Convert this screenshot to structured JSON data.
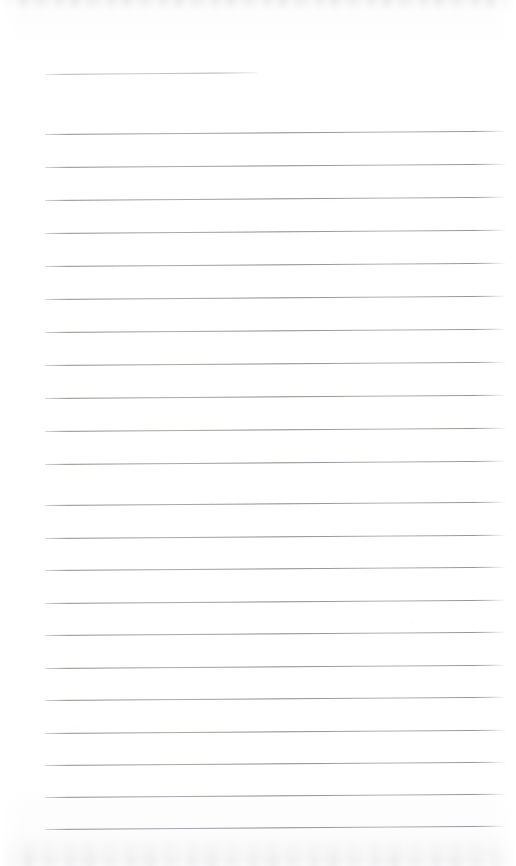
{
  "document": {
    "kind": "scanned-blank-ruled-page",
    "page_width": 516,
    "page_height": 866,
    "background_color": "#ffffff",
    "rule_color": "#8a8a94",
    "content_text": ""
  },
  "scan_artifacts": {
    "top_band": {
      "y": 0,
      "height": 12,
      "color": "#e9e9ec"
    },
    "bottom_band": {
      "y": 838,
      "height": 28,
      "color": "#ececef"
    }
  },
  "header_rule": {
    "label": "header-rule",
    "x": 45,
    "y": 74,
    "width": 212,
    "tilt_deg": -0.5
  },
  "rules": {
    "left_x": 45,
    "right_x": 505,
    "width": 460,
    "tilt_deg": -0.42,
    "spacing": 32.5,
    "count": 22,
    "lines": [
      {
        "index": 1,
        "y": 134
      },
      {
        "index": 2,
        "y": 167
      },
      {
        "index": 3,
        "y": 200
      },
      {
        "index": 4,
        "y": 233
      },
      {
        "index": 5,
        "y": 266
      },
      {
        "index": 6,
        "y": 299
      },
      {
        "index": 7,
        "y": 332
      },
      {
        "index": 8,
        "y": 365
      },
      {
        "index": 9,
        "y": 398
      },
      {
        "index": 10,
        "y": 431
      },
      {
        "index": 11,
        "y": 464
      },
      {
        "index": 12,
        "y": 505
      },
      {
        "index": 13,
        "y": 538
      },
      {
        "index": 14,
        "y": 570
      },
      {
        "index": 15,
        "y": 603
      },
      {
        "index": 16,
        "y": 635
      },
      {
        "index": 17,
        "y": 668
      },
      {
        "index": 18,
        "y": 700
      },
      {
        "index": 19,
        "y": 733
      },
      {
        "index": 20,
        "y": 765
      },
      {
        "index": 21,
        "y": 797
      },
      {
        "index": 22,
        "y": 829
      }
    ]
  }
}
